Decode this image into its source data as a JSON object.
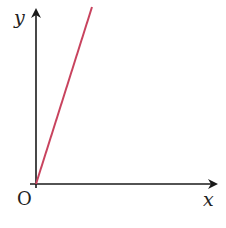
{
  "diagram": {
    "title": "",
    "axes": {
      "x_label": "x",
      "y_label": "y",
      "origin_label": "O",
      "axis_color": "#1a1a1a"
    },
    "line": {
      "description": "straight line through origin with positive gradient",
      "color": "#c8435e",
      "from": [
        0,
        0
      ],
      "slope_sign": "positive"
    }
  }
}
